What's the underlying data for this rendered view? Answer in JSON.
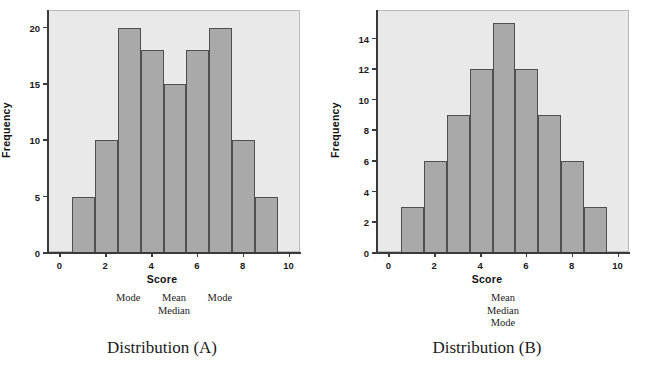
{
  "figure": {
    "background": "#ffffff",
    "plot_background": "#e9e9e9",
    "bar_fill": "#a9a9a9",
    "bar_edge": "#4f4f4f",
    "axis_color": "#3a3a3a"
  },
  "panels": [
    {
      "id": "distribution-a",
      "caption": "Distribution (A)",
      "annotations": [
        {
          "score": 3,
          "lines": [
            "Mode"
          ]
        },
        {
          "score": 5,
          "lines": [
            "Mean",
            "Median"
          ]
        },
        {
          "score": 7,
          "lines": [
            "Mode"
          ]
        }
      ]
    },
    {
      "id": "distribution-b",
      "caption": "Distribution (B)",
      "annotations": [
        {
          "score": 5,
          "lines": [
            "Mean",
            "Median",
            "Mode"
          ]
        }
      ]
    }
  ],
  "chart_data": [
    {
      "type": "bar",
      "id": "distribution-a",
      "title": "Distribution (A)",
      "xlabel": "Score",
      "ylabel": "Frequency",
      "categories": [
        "1",
        "2",
        "3",
        "4",
        "5",
        "6",
        "7",
        "8",
        "9"
      ],
      "x": [
        1,
        2,
        3,
        4,
        5,
        6,
        7,
        8,
        9
      ],
      "values": [
        5,
        10,
        20,
        18,
        15,
        18,
        20,
        10,
        5
      ],
      "bar_width": 1,
      "xlim": [
        -0.5,
        10.5
      ],
      "ylim": [
        0,
        21.5
      ],
      "xticks": [
        0,
        2,
        4,
        6,
        8,
        10
      ],
      "xticklabels": [
        "0",
        "2",
        "4",
        "6",
        "8",
        "10"
      ],
      "yticks": [
        0,
        5,
        10,
        15,
        20
      ],
      "yticklabels": [
        "0",
        "5",
        "10",
        "15",
        "20"
      ],
      "grid": false,
      "legend": "none",
      "annotations": [
        {
          "text": "Mode",
          "x": 3
        },
        {
          "text": "Mean",
          "x": 5
        },
        {
          "text": "Median",
          "x": 5
        },
        {
          "text": "Mode",
          "x": 7
        }
      ]
    },
    {
      "type": "bar",
      "id": "distribution-b",
      "title": "Distribution (B)",
      "xlabel": "Score",
      "ylabel": "Frequency",
      "categories": [
        "1",
        "2",
        "3",
        "4",
        "5",
        "6",
        "7",
        "8",
        "9"
      ],
      "x": [
        1,
        2,
        3,
        4,
        5,
        6,
        7,
        8,
        9
      ],
      "values": [
        3,
        6,
        9,
        12,
        15,
        12,
        9,
        6,
        3
      ],
      "bar_width": 1,
      "xlim": [
        -0.5,
        10.5
      ],
      "ylim": [
        0,
        15.8
      ],
      "xticks": [
        0,
        2,
        4,
        6,
        8,
        10
      ],
      "xticklabels": [
        "0",
        "2",
        "4",
        "6",
        "8",
        "10"
      ],
      "yticks": [
        0,
        2,
        4,
        6,
        8,
        10,
        12,
        14
      ],
      "yticklabels": [
        "0",
        "2",
        "4",
        "6",
        "8",
        "10",
        "12",
        "14"
      ],
      "grid": false,
      "legend": "none",
      "annotations": [
        {
          "text": "Mean",
          "x": 5
        },
        {
          "text": "Median",
          "x": 5
        },
        {
          "text": "Mode",
          "x": 5
        }
      ]
    }
  ]
}
